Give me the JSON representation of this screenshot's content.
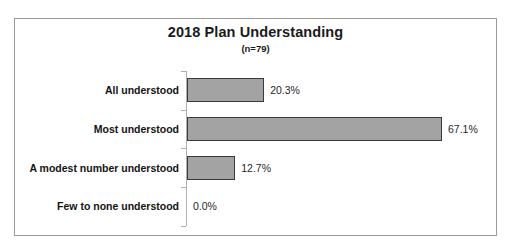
{
  "chart_data": {
    "type": "bar",
    "orientation": "horizontal",
    "title": "2018 Plan Understanding",
    "subtitle": "(n=79)",
    "sample_size_label": "(n=79)",
    "xlabel": "",
    "ylabel": "",
    "grid": false,
    "legend": "none",
    "xlim": [
      0,
      70
    ],
    "value_suffix": "%",
    "categories": [
      "All understood",
      "Most understood",
      "A modest number understood",
      "Few to none understood"
    ],
    "values": [
      20.3,
      67.1,
      12.7,
      0.0
    ],
    "value_labels": [
      "20.3%",
      "67.1%",
      "12.7%",
      "0.0%"
    ],
    "bars": [
      {
        "category": "All understood",
        "value": 20.3,
        "label": "20.3%"
      },
      {
        "category": "Most understood",
        "value": 67.1,
        "label": "67.1%"
      },
      {
        "category": "A modest number understood",
        "value": 12.7,
        "label": "12.7%"
      },
      {
        "category": "Few to none understood",
        "value": 0.0,
        "label": "0.0%"
      }
    ],
    "colors": {
      "bar_fill": "#a3a3a3",
      "bar_border": "#3a3a3a",
      "axis": "#b0b0b0",
      "frame": "#9a9a9a",
      "text": "#141414",
      "background": "#ffffff"
    }
  }
}
